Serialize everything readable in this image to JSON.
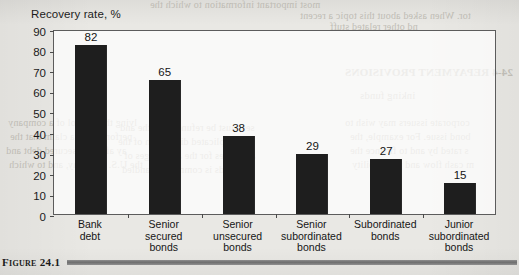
{
  "figure": {
    "label": "Figure 24.1",
    "caption_rule": true
  },
  "chart_data": {
    "type": "bar",
    "title": "",
    "axis_note": "Recovery rate, %",
    "xlabel": "",
    "ylabel": "Recovery rate, %",
    "ylim": [
      0,
      90
    ],
    "ytick_step": 10,
    "yticks": [
      90,
      80,
      70,
      60,
      50,
      40,
      30,
      20,
      10,
      0
    ],
    "grid": false,
    "legend": "none",
    "bar_color": "#1e1e1e",
    "frame_color": "#5c5c5c",
    "categories": [
      "Bank debt",
      "Senior secured bonds",
      "Senior unsecured bonds",
      "Senior subordinated bonds",
      "Subordinated bonds",
      "Junior subordinated bonds"
    ],
    "category_lines": [
      [
        "Bank",
        "debt"
      ],
      [
        "Senior",
        "secured",
        "bonds"
      ],
      [
        "Senior",
        "unsecured",
        "bonds"
      ],
      [
        "Senior",
        "subordinated",
        "bonds"
      ],
      [
        "Subordinated",
        "bonds"
      ],
      [
        "Junior",
        "subordinated",
        "bonds"
      ]
    ],
    "values": [
      82,
      65,
      38,
      29,
      27,
      15
    ],
    "value_labels": [
      "82",
      "65",
      "38",
      "29",
      "27",
      "15"
    ]
  },
  "page_background": {
    "color": "#e9e8e4",
    "showthrough_lines": [
      "most important information to which the",
      "in the beginning of the chapter",
      "tor.  When asked about this topic a recent",
      "nd other related stuff",
      "24-4    REPAYMENT PROVISIONS",
      "inking funds",
      "corporate issuers may wish to",
      "bond issue.  For example, the",
      "s rated by and to finance the",
      "m cash flow and profitability",
      "lving the control of a company",
      "perform with a claim that the",
      "ay after the secured debt and",
      "the U.S. company, and to which",
      "ts, the company was recently",
      "ses must be refunded by the and",
      "complicated discussion of the",
      "able rules for the advantages of",
      "ce bonds is commonly handled"
    ]
  }
}
